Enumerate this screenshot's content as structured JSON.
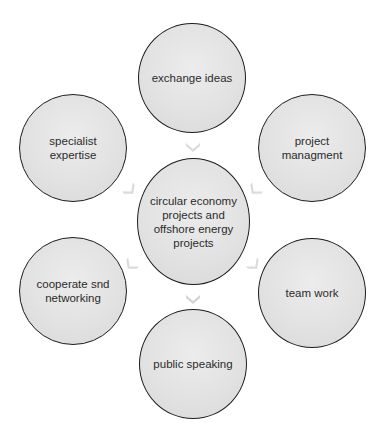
{
  "diagram": {
    "type": "radial-cycle",
    "center": {
      "label": "circular economy\nprojects and\noffshore energy\nprojects"
    },
    "nodes": [
      {
        "id": "top",
        "label": "exchange ideas"
      },
      {
        "id": "top-right",
        "label": "project\nmanagment"
      },
      {
        "id": "bottom-right",
        "label": "team work"
      },
      {
        "id": "bottom",
        "label": "public speaking"
      },
      {
        "id": "bottom-left",
        "label": "cooperate  snd\nnetworking"
      },
      {
        "id": "top-left",
        "label": "specialist\nexpertise"
      }
    ],
    "arrows": [
      {
        "from": "top",
        "to": "center",
        "icon": "chevron-arrow"
      },
      {
        "from": "top-right",
        "to": "center",
        "icon": "chevron-arrow"
      },
      {
        "from": "center",
        "to": "bottom-right",
        "icon": "chevron-arrow"
      },
      {
        "from": "center",
        "to": "bottom",
        "icon": "chevron-arrow"
      },
      {
        "from": "center",
        "to": "bottom-left",
        "icon": "chevron-arrow"
      },
      {
        "from": "top-left",
        "to": "center",
        "icon": "chevron-arrow"
      }
    ],
    "colors": {
      "node_fill": "#e4e4e4",
      "node_border": "#1c1c1c",
      "text": "#2b2b2b",
      "arrow": "#dcdcdc"
    }
  }
}
